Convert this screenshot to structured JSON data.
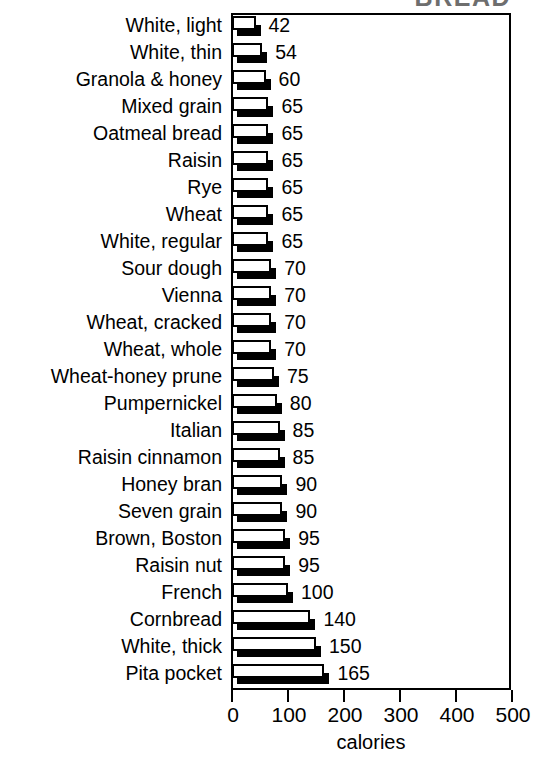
{
  "chart_data": {
    "type": "bar",
    "orientation": "horizontal",
    "title": "BREAD",
    "title_note": "clipped at top edge of image",
    "xlabel": "calories",
    "ylabel": "",
    "xlim": [
      0,
      500
    ],
    "xticks": [
      0,
      100,
      200,
      300,
      400,
      500
    ],
    "xtick_labels": [
      "0",
      "100",
      "200",
      "300",
      "400",
      "500"
    ],
    "grid": false,
    "legend": null,
    "bar_style": "white fill, black outline, black 3D drop shadow",
    "categories": [
      "White, light",
      "White, thin",
      "Granola & honey",
      "Mixed grain",
      "Oatmeal bread",
      "Raisin",
      "Rye",
      "Wheat",
      "White, regular",
      "Sour dough",
      "Vienna",
      "Wheat, cracked",
      "Wheat, whole",
      "Wheat-honey prune",
      "Pumpernickel",
      "Italian",
      "Raisin cinnamon",
      "Honey bran",
      "Seven grain",
      "Brown, Boston",
      "Raisin nut",
      "French",
      "Cornbread",
      "White, thick",
      "Pita pocket"
    ],
    "values": [
      42,
      54,
      60,
      65,
      65,
      65,
      65,
      65,
      65,
      70,
      70,
      70,
      70,
      75,
      80,
      85,
      85,
      90,
      90,
      95,
      95,
      100,
      140,
      150,
      165
    ],
    "value_labels": [
      "42",
      "54",
      "60",
      "65",
      "65",
      "65",
      "65",
      "65",
      "65",
      "70",
      "70",
      "70",
      "70",
      "75",
      "80",
      "85",
      "85",
      "90",
      "90",
      "95",
      "95",
      "100",
      "140",
      "150",
      "165"
    ]
  },
  "colors": {
    "bar_fill": "#ffffff",
    "bar_outline": "#000000",
    "bar_shadow": "#000000",
    "axis": "#000000",
    "text": "#000000",
    "background": "#ffffff",
    "title": "#6e6e6e"
  }
}
